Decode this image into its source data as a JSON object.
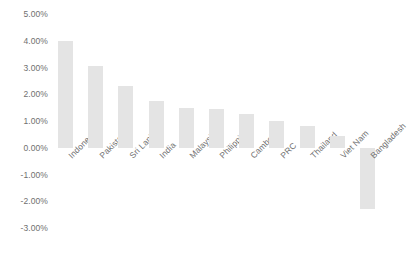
{
  "chart_data": {
    "type": "bar",
    "title": "",
    "subtitle": "",
    "xlabel": "",
    "ylabel": "",
    "categories": [
      "Indonesia",
      "Pakistan",
      "Sri Lanka",
      "India",
      "Malaysia",
      "Philippines",
      "Cambodia",
      "PRC",
      "Thailand",
      "Viet Nam",
      "Bangladesh"
    ],
    "values": [
      4.0,
      3.05,
      2.3,
      1.75,
      1.5,
      1.45,
      1.25,
      1.0,
      0.8,
      0.45,
      -2.3
    ],
    "value_unit": "%",
    "ylim": [
      -3.0,
      5.0
    ],
    "ytick_values": [
      5.0,
      4.0,
      3.0,
      2.0,
      1.0,
      0.0,
      -1.0,
      -2.0,
      -3.0
    ],
    "ytick_labels": [
      "5.00%",
      "4.00%",
      "3.00%",
      "2.00%",
      "1.00%",
      "0.00%",
      "-1.00%",
      "-2.00%",
      "-3.00%"
    ],
    "grid": false,
    "legend": false,
    "legend_position": "none",
    "bar_color": "#e4e4e4",
    "axis_text_color": "#6f6f6f",
    "background_color": "#ffffff",
    "label_rotation_degrees": -45
  }
}
